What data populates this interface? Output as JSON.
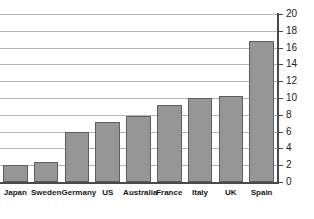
{
  "chart_data": {
    "type": "bar",
    "title": "",
    "subtitle": "",
    "xlabel": "",
    "ylabel": "",
    "categories": [
      "Japan",
      "Sweden",
      "Germany",
      "US",
      "Australia",
      "France",
      "Italy",
      "UK",
      "Spain"
    ],
    "values": [
      2.0,
      2.4,
      6.0,
      7.2,
      7.8,
      9.2,
      10.0,
      10.2,
      16.8
    ],
    "ylim": [
      0,
      20
    ],
    "ytick_interval": 2,
    "ytick_labels": [
      "0",
      "2",
      "4",
      "6",
      "8",
      "10",
      "12",
      "14",
      "16",
      "18",
      "20"
    ],
    "ytick_values": [
      0,
      2,
      4,
      6,
      8,
      10,
      12,
      14,
      16,
      18,
      20
    ],
    "grid": true,
    "grid_axis": "y",
    "legend": false,
    "legend_position": "none",
    "yaxis_position": "right",
    "annotations": []
  },
  "style": {
    "bar_fill": "#969696",
    "bar_border": "#5e5e5e",
    "gridline_color": "#b6b6b6",
    "axis_color": "#4a4a4a",
    "label_color": "#161616",
    "tick_label_color": "#1a1a1a",
    "background": "#ffffff"
  }
}
